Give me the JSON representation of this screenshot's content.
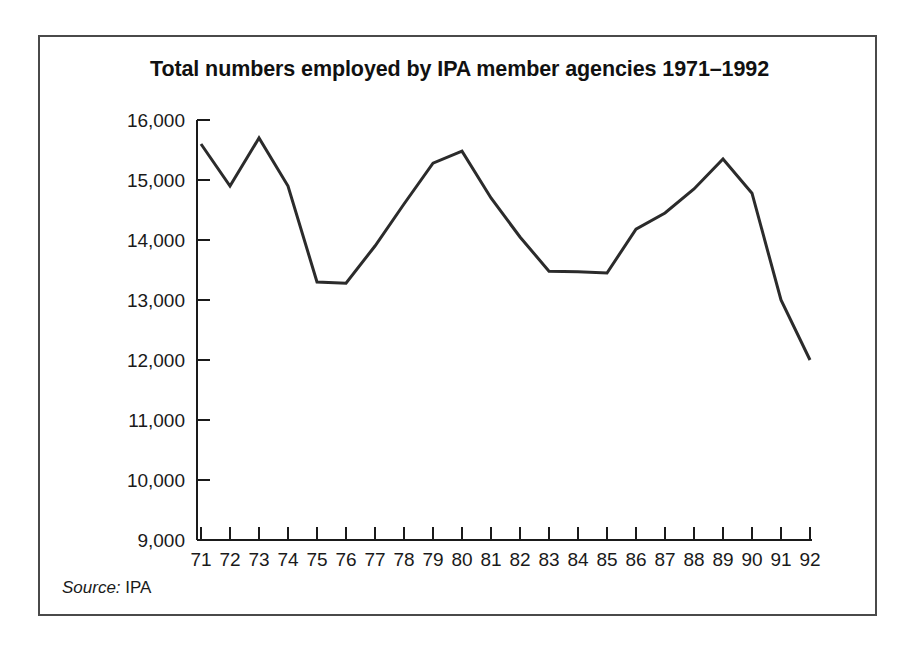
{
  "figure": {
    "title": "Total numbers employed by IPA member agencies 1971–1992",
    "source_label": "Source:",
    "source_value": "IPA",
    "frame_color": "#4a4a4a",
    "line_color": "#2b2b2b",
    "background": "#ffffff"
  },
  "chart_data": {
    "type": "line",
    "title": "Total numbers employed by IPA member agencies 1971–1992",
    "xlabel": "",
    "ylabel": "",
    "categories": [
      "71",
      "72",
      "73",
      "74",
      "75",
      "76",
      "77",
      "78",
      "79",
      "80",
      "81",
      "82",
      "83",
      "84",
      "85",
      "86",
      "87",
      "88",
      "89",
      "90",
      "91",
      "92"
    ],
    "values": [
      15600,
      14900,
      15700,
      14900,
      13300,
      13280,
      13900,
      14600,
      15280,
      15480,
      14700,
      14050,
      13480,
      13470,
      13450,
      14180,
      14450,
      14850,
      15350,
      14780,
      13000,
      12000
    ],
    "series": [
      {
        "name": "Total numbers employed",
        "values": [
          15600,
          14900,
          15700,
          14900,
          13300,
          13280,
          13900,
          14600,
          15280,
          15480,
          14700,
          14050,
          13480,
          13470,
          13450,
          14180,
          14450,
          14850,
          15350,
          14780,
          13000,
          12000
        ]
      }
    ],
    "ylim": [
      9000,
      16000
    ],
    "ytick_values": [
      9000,
      10000,
      11000,
      12000,
      13000,
      14000,
      15000,
      16000
    ],
    "ytick_labels": [
      "9,000",
      "10,000",
      "11,000",
      "12,000",
      "13,000",
      "14,000",
      "15,000",
      "16,000"
    ],
    "xtick_labels": [
      "71",
      "72",
      "73",
      "74",
      "75",
      "76",
      "77",
      "78",
      "79",
      "80",
      "81",
      "82",
      "83",
      "84",
      "85",
      "86",
      "87",
      "88",
      "89",
      "90",
      "91",
      "92"
    ],
    "grid": false,
    "legend": false,
    "legend_position": "none",
    "annotations": [
      "Source: IPA"
    ]
  }
}
